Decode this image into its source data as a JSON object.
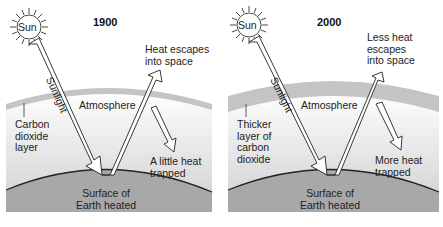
{
  "panels": [
    {
      "year": "1900",
      "sun": "Sun",
      "sunlight": "Sunlight",
      "atmosphere": "Atmosphere",
      "escape": "Heat escapes into space",
      "escape_lines": [
        "Heat escapes",
        "into space"
      ],
      "layer_lines": [
        "Carbon",
        "dioxide",
        "layer"
      ],
      "trapped_lines": [
        "A little heat",
        "trapped"
      ],
      "surface_lines": [
        "Surface of",
        "Earth heated"
      ],
      "band_thickness": "thin"
    },
    {
      "year": "2000",
      "sun": "Sun",
      "sunlight": "Sunlight",
      "atmosphere": "Atmosphere",
      "escape_lines": [
        "Less heat",
        "escapes",
        "into space"
      ],
      "layer_lines": [
        "Thicker",
        "layer of",
        "carbon",
        "dioxide"
      ],
      "trapped_lines": [
        "More heat",
        "trapped"
      ],
      "surface_lines": [
        "Surface of",
        "Earth heated"
      ],
      "band_thickness": "thick"
    }
  ],
  "colors": {
    "band": "#c8c8c8",
    "sky_top": "#ffffff",
    "sky_bottom": "#d2d2d2",
    "earth": "#a9a9a9",
    "outline": "#222222"
  }
}
